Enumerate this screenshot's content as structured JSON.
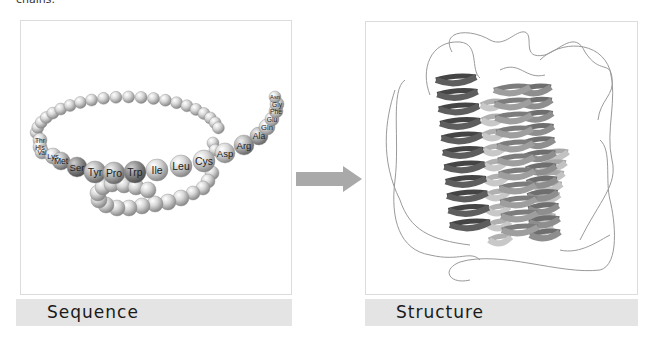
{
  "header": {
    "cut_off_text": "chains."
  },
  "panels": {
    "sequence": {
      "caption": "Sequence"
    },
    "structure": {
      "caption": "Structure"
    }
  },
  "arrow": {
    "direction": "right",
    "color": "#a9a9a9"
  },
  "sequence_chain": {
    "labeled_residues": [
      {
        "label": "Thr",
        "x": 40,
        "y": 140,
        "r": 7
      },
      {
        "label": "His",
        "x": 40,
        "y": 147,
        "r": 7
      },
      {
        "label": "Val",
        "x": 42,
        "y": 152,
        "r": 7
      },
      {
        "label": "Lys",
        "x": 53,
        "y": 156,
        "r": 8
      },
      {
        "label": "Met",
        "x": 61,
        "y": 161,
        "r": 9
      },
      {
        "label": "Ser",
        "x": 77,
        "y": 167,
        "r": 10
      },
      {
        "label": "Tyr",
        "x": 95,
        "y": 172,
        "r": 11
      },
      {
        "label": "Pro",
        "x": 114,
        "y": 173,
        "r": 11
      },
      {
        "label": "Trp",
        "x": 135,
        "y": 172,
        "r": 11
      },
      {
        "label": "Ile",
        "x": 157,
        "y": 170,
        "r": 11
      },
      {
        "label": "Leu",
        "x": 181,
        "y": 166,
        "r": 11
      },
      {
        "label": "Cys",
        "x": 204,
        "y": 161,
        "r": 11
      },
      {
        "label": "Asp",
        "x": 225,
        "y": 153,
        "r": 10
      },
      {
        "label": "Arg",
        "x": 244,
        "y": 145,
        "r": 10
      },
      {
        "label": "Ala",
        "x": 259,
        "y": 136,
        "r": 9
      },
      {
        "label": "Gln",
        "x": 267,
        "y": 127,
        "r": 8
      },
      {
        "label": "Glu",
        "x": 272,
        "y": 119,
        "r": 7
      },
      {
        "label": "Phe",
        "x": 276,
        "y": 111,
        "r": 7
      },
      {
        "label": "Gly",
        "x": 277,
        "y": 104,
        "r": 7
      },
      {
        "label": "Asn",
        "x": 275,
        "y": 97,
        "r": 6
      }
    ]
  }
}
